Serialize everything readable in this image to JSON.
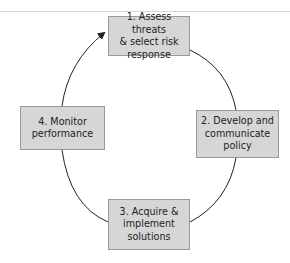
{
  "diagram": {
    "type": "cycle",
    "steps": [
      {
        "id": 1,
        "label": "1. Assess threats\n& select risk\nresponse"
      },
      {
        "id": 2,
        "label": "2. Develop and\ncommunicate\npolicy"
      },
      {
        "id": 3,
        "label": "3. Acquire &\nimplement\nsolutions"
      },
      {
        "id": 4,
        "label": "4. Monitor\nperformance"
      }
    ],
    "flow": [
      "1 -> 2",
      "2 -> 3",
      "3 -> 4",
      "4 -> 1"
    ],
    "colors": {
      "box_fill": "#d6d6d6",
      "box_border": "#9a9a9a",
      "arrow": "#222222"
    }
  }
}
